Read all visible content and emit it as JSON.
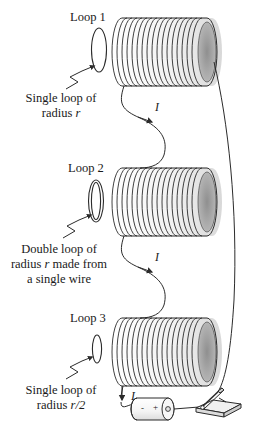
{
  "figure": {
    "background_color": "#ffffff",
    "line_color": "#2b2b2b"
  },
  "loops": [
    {
      "title": "Loop 1",
      "caption_lines": [
        "Single loop of",
        "radius "
      ],
      "caption_italic": "r",
      "caption_tail": "",
      "loop_type": "single",
      "current_label": "I"
    },
    {
      "title": "Loop 2",
      "caption_lines": [
        "Double loop of",
        "radius ",
        " made from",
        "a single wire"
      ],
      "caption_italic": "r",
      "loop_type": "double",
      "current_label": "I"
    },
    {
      "title": "Loop 3",
      "caption_lines": [
        "Single loop of",
        "radius "
      ],
      "caption_italic": "r/2",
      "loop_type": "single-half",
      "current_label": "I"
    }
  ],
  "captions": {
    "loop1_title": "Loop 1",
    "loop1_line1": "Single loop of",
    "loop1_line2_prefix": "radius ",
    "loop1_line2_italic": "r",
    "loop2_title": "Loop 2",
    "loop2_line1": "Double loop of",
    "loop2_line2_prefix": "radius ",
    "loop2_line2_italic": "r",
    "loop2_line2_suffix": " made from",
    "loop2_line3": "a single wire",
    "loop3_title": "Loop 3",
    "loop3_line1": "Single loop of",
    "loop3_line2_prefix": "radius ",
    "loop3_line2_italic": "r/2"
  },
  "current_labels": {
    "top": "I",
    "middle": "I",
    "bottom": "I"
  },
  "battery": {
    "negative_terminal": "-",
    "positive_terminal": "+"
  },
  "switch": {
    "name": "knife-switch",
    "state": "open"
  },
  "solenoids": [
    {
      "name": "solenoid-1",
      "turns": 17
    },
    {
      "name": "solenoid-2",
      "turns": 17
    },
    {
      "name": "solenoid-3",
      "turns": 17
    }
  ]
}
